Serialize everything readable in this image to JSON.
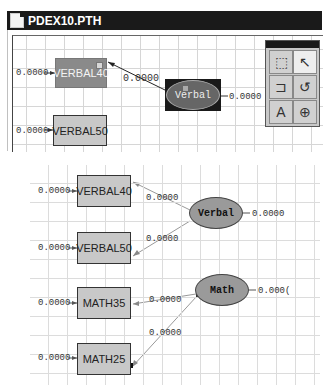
{
  "window": {
    "title": "PDEX10.PTH"
  },
  "top_diagram": {
    "observed": [
      {
        "label": "VERBAL40",
        "error": "0.0000",
        "selected": true
      },
      {
        "label": "VERBAL50",
        "error": "0.0000",
        "selected": false
      }
    ],
    "latent": {
      "label": "Verbal",
      "variance": "0.0000",
      "selected": true
    },
    "paths": [
      {
        "from": "Verbal",
        "to": "VERBAL40",
        "value": "0.0000"
      }
    ]
  },
  "toolbox": {
    "tools": [
      {
        "name": "select-rectangle",
        "glyph": "⬚"
      },
      {
        "name": "arrow",
        "glyph": "↖"
      },
      {
        "name": "one-way-path",
        "glyph": "⊐"
      },
      {
        "name": "curved-path",
        "glyph": "↺"
      },
      {
        "name": "text",
        "glyph": "A"
      },
      {
        "name": "zoom",
        "glyph": "⊕"
      }
    ]
  },
  "bottom_diagram": {
    "observed": [
      {
        "label": "VERBAL40",
        "error": "0.0000"
      },
      {
        "label": "VERBAL50",
        "error": "0.0000"
      },
      {
        "label": "MATH35",
        "error": "0.0000"
      },
      {
        "label": "MATH25",
        "error": "0.0000"
      }
    ],
    "latent": [
      {
        "label": "Verbal",
        "variance": "0.0000"
      },
      {
        "label": "Math",
        "variance": "0.000("
      }
    ],
    "paths": [
      {
        "from": "Verbal",
        "to": "VERBAL40",
        "value": "0.0000"
      },
      {
        "from": "Verbal",
        "to": "VERBAL50",
        "value": "0.0000"
      },
      {
        "from": "Math",
        "to": "MATH35",
        "value": "0.0000"
      },
      {
        "from": "Math",
        "to": "MATH25",
        "value": "0.0000"
      }
    ]
  }
}
